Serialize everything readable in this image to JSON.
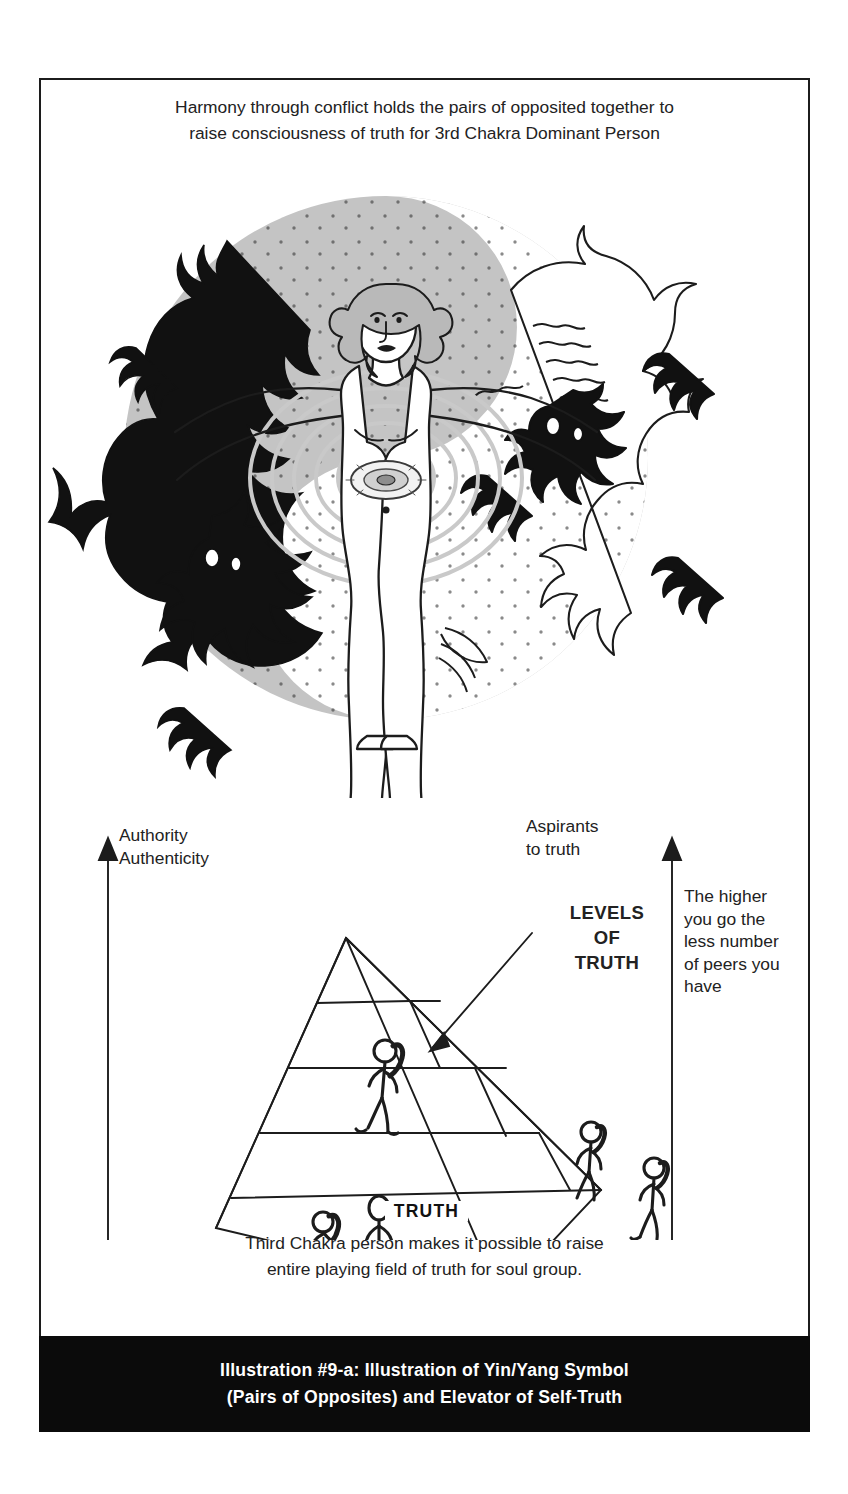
{
  "header": {
    "line1": "Harmony through conflict holds the pairs of opposited together to",
    "line2": "raise consciousness of truth for 3rd Chakra Dominant Person"
  },
  "labels": {
    "authority_line1": "Authority",
    "authority_line2": "Authenticity",
    "aspirants_line1": "Aspirants",
    "aspirants_line2": "to truth",
    "levels_line1": "LEVELS",
    "levels_line2": "OF",
    "levels_line3": "TRUTH",
    "higher_line1": "The higher",
    "higher_line2": "you go the",
    "higher_line3": "less number",
    "higher_line4": "of peers you",
    "higher_line5": "have",
    "baseline_axis": "TRUTH"
  },
  "footer": {
    "line1": "Third Chakra person makes it possible to raise",
    "line2": "entire playing field of truth for soul group."
  },
  "caption": {
    "line1": "Illustration #9-a: Illustration of Yin/Yang Symbol",
    "line2": "(Pairs of Opposites) and Elevator of Self-Truth"
  },
  "colors": {
    "ink": "#1c1c1c",
    "paper": "#ffffff",
    "yin_gray": "#bdbdbd",
    "light_gray": "#d8d8d8",
    "caption_bg": "#0b0b0b",
    "caption_fg": "#ffffff"
  },
  "diagram": {
    "type": "pyramid-hierarchy",
    "tier_count": 5,
    "tiers_from_top": [
      {
        "index": 1,
        "occupants": 0
      },
      {
        "index": 2,
        "occupants": 0
      },
      {
        "index": 3,
        "occupants": 1
      },
      {
        "index": 4,
        "occupants": 2
      },
      {
        "index": 5,
        "occupants": 2
      }
    ],
    "apex_figure": "standing-person-on-apex",
    "axes": [
      {
        "name": "left-vertical-arrow",
        "direction": "up",
        "meaning": "Authority / Authenticity"
      },
      {
        "name": "right-vertical-arrow",
        "direction": "up",
        "meaning": "The higher you go the less number of peers you have"
      },
      {
        "name": "baseline",
        "direction": "horizontal",
        "meaning": "TRUTH"
      }
    ],
    "artwork": {
      "symbol": "yin-yang-circle",
      "black_creature": "black-dragon-left",
      "white_creature": "white-dragon-right",
      "center_figure": "human-figure-arms-outstretched",
      "chakra": "third-chakra-solar-plexus-glow"
    }
  }
}
